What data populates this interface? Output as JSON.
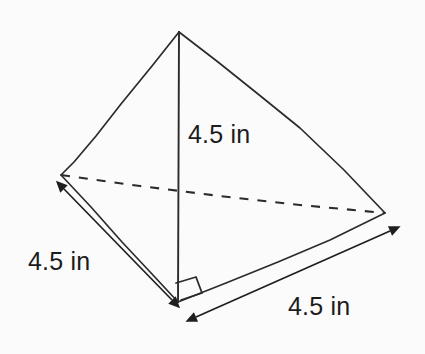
{
  "figure": {
    "shape": "triangular-pyramid",
    "stroke_color": "#2b2b2b",
    "background_color": "#fbfbfb",
    "text_color": "#1c1c1c",
    "vertices": {
      "apex": {
        "x": 179,
        "y": 32
      },
      "back_left": {
        "x": 61,
        "y": 175
      },
      "right": {
        "x": 385,
        "y": 213
      },
      "front": {
        "x": 178,
        "y": 302
      }
    },
    "edges": [
      {
        "name": "apex-to-back-left",
        "style": "solid"
      },
      {
        "name": "apex-to-right",
        "style": "solid"
      },
      {
        "name": "altitude",
        "style": "solid"
      },
      {
        "name": "back-left-to-front",
        "style": "solid"
      },
      {
        "name": "front-to-right",
        "style": "solid"
      },
      {
        "name": "back-left-to-right",
        "style": "dashed"
      }
    ],
    "right_angle_marker": {
      "name": "right-angle-marker",
      "location": "base of altitude at front vertex"
    }
  },
  "dimensions": {
    "height": {
      "label": "4.5 in",
      "value": 4.5,
      "unit": "in",
      "measures": "pyramid height (altitude)"
    },
    "left_edge": {
      "label": "4.5 in",
      "value": 4.5,
      "unit": "in",
      "measures": "base edge, back-left to front"
    },
    "right_edge": {
      "label": "4.5 in",
      "value": 4.5,
      "unit": "in",
      "measures": "base edge, front to right"
    }
  }
}
